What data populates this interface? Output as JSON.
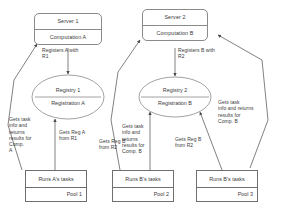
{
  "diagram": {
    "stroke_color": "#8a8a8a",
    "text_color": "#3a3a3a",
    "background": "#ffffff"
  },
  "servers": [
    {
      "id": "server1",
      "title": "Server 1",
      "computation": "Computation A"
    },
    {
      "id": "server2",
      "title": "Server 2",
      "computation": "Computation B"
    }
  ],
  "registries": [
    {
      "id": "registry1",
      "title": "Registry 1",
      "registration": "Registration A"
    },
    {
      "id": "registry2",
      "title": "Registry 2",
      "registration": "Registration B"
    }
  ],
  "pools": [
    {
      "id": "pool1",
      "task": "Runs A's tasks",
      "name": "Pool 1"
    },
    {
      "id": "pool2",
      "task": "Runs B's tasks",
      "name": "Pool 2"
    },
    {
      "id": "pool3",
      "task": "Runs B's tasks",
      "name": "Pool 3"
    }
  ],
  "edge_labels": [
    {
      "id": "register-a",
      "text": "Registers A with\nR1"
    },
    {
      "id": "register-b",
      "text": "Registers B with\nR2"
    },
    {
      "id": "gets-task-a",
      "text": "Gets task\ninfo and\nreturns\nresults for\nComp.\nA"
    },
    {
      "id": "gets-reg-a",
      "text": "Gets Reg A\nfrom R1"
    },
    {
      "id": "gets-task-b-left",
      "text": "Gets task\ninfo and\nreturns\nresults for\nComp. B"
    },
    {
      "id": "gets-reg-b-left",
      "text": "Gets Reg B\nfrom R2"
    },
    {
      "id": "gets-reg-b-right",
      "text": "Gets Reg B\nfrom R2"
    },
    {
      "id": "gets-task-b-right",
      "text": "Gets task\ninfo and returns\nresults for\nComp. B"
    }
  ]
}
